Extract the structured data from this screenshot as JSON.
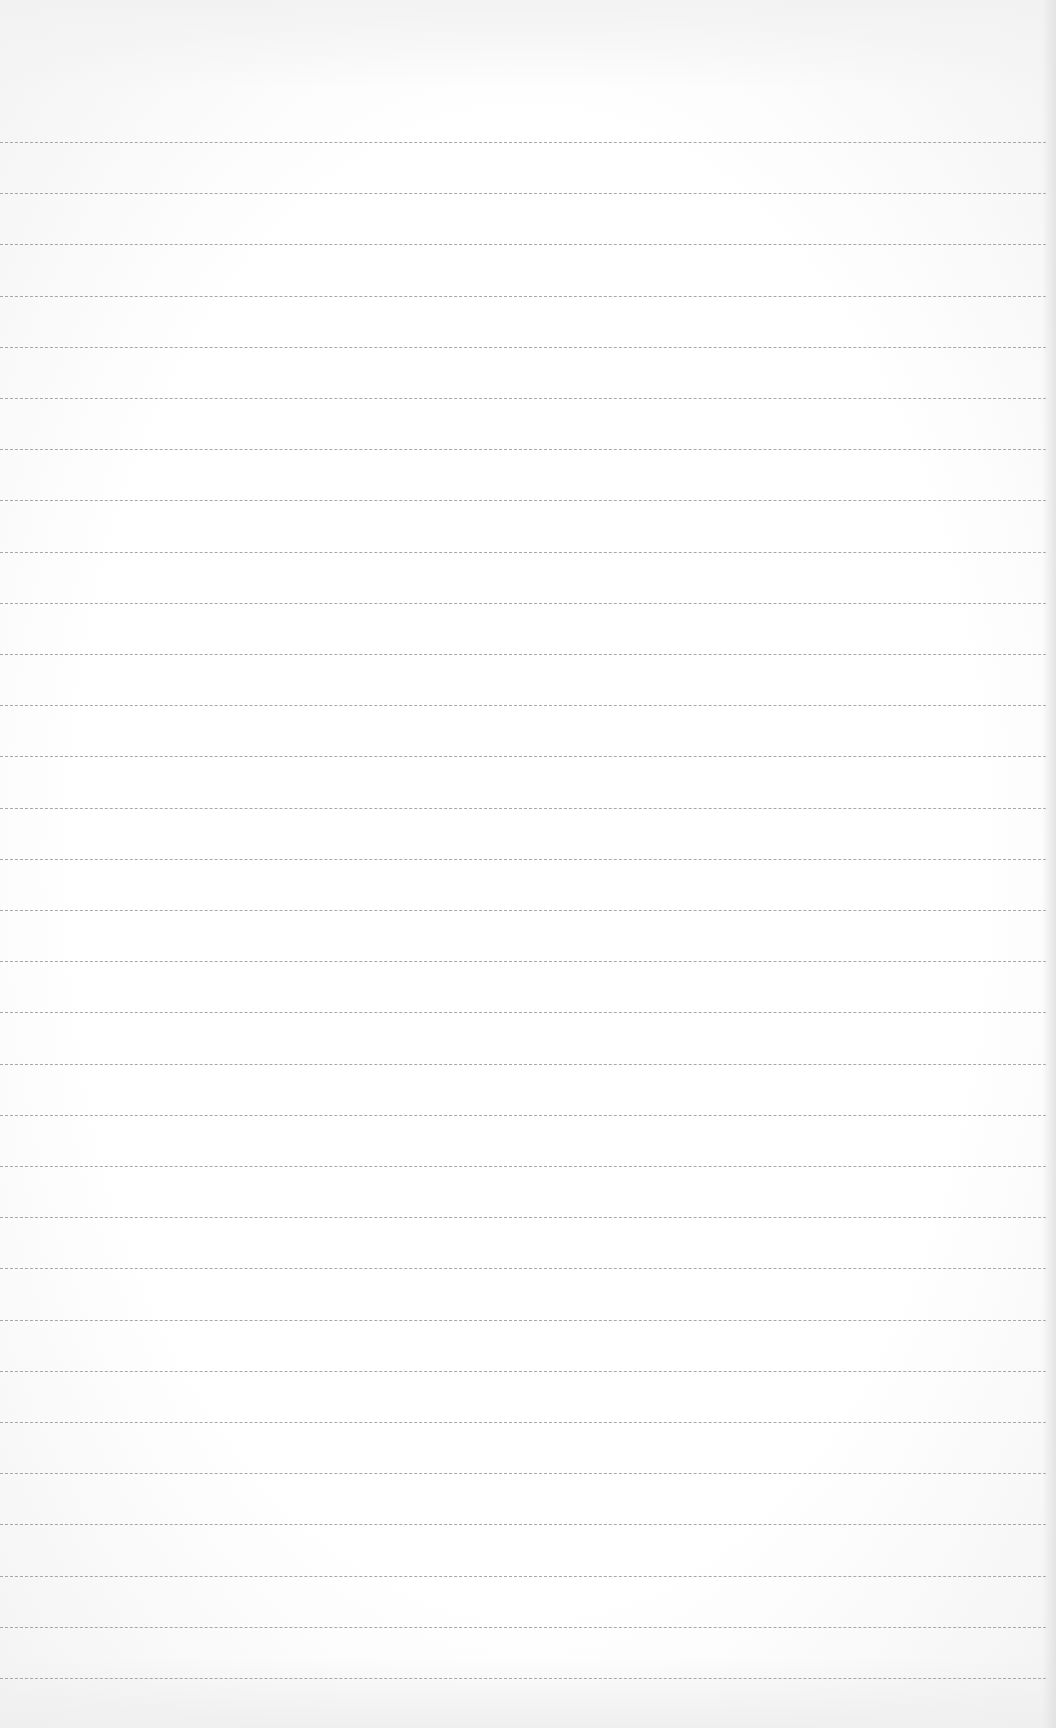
{
  "page": {
    "type": "lined-paper",
    "background_color": "#fbfbfb",
    "line_color": "#9a9a9a",
    "line_count": 31,
    "first_line_y": 142,
    "line_spacing": 51.2
  }
}
